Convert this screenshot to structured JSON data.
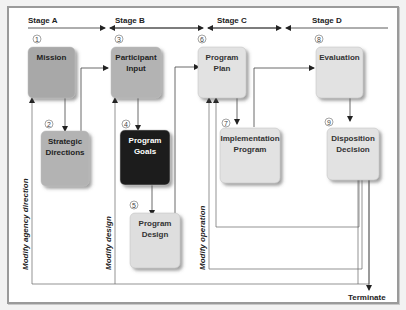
{
  "stages": [
    {
      "id": "A",
      "label": "Stage A"
    },
    {
      "id": "B",
      "label": "Stage B"
    },
    {
      "id": "C",
      "label": "Stage C"
    },
    {
      "id": "D",
      "label": "Stage D"
    }
  ],
  "nodes": [
    {
      "num": "1",
      "lines": [
        "Mission"
      ],
      "fill": "#a8a8a8",
      "text": "#222222"
    },
    {
      "num": "2",
      "lines": [
        "Strategic",
        "Directions"
      ],
      "fill": "#b3b3b3",
      "text": "#222222"
    },
    {
      "num": "3",
      "lines": [
        "Participant",
        "Input"
      ],
      "fill": "#b3b3b3",
      "text": "#222222"
    },
    {
      "num": "4",
      "lines": [
        "Program",
        "Goals"
      ],
      "fill": "#1e1e1e",
      "text": "#ffffff"
    },
    {
      "num": "5",
      "lines": [
        "Program",
        "Design"
      ],
      "fill": "#dedede",
      "text": "#333333"
    },
    {
      "num": "6",
      "lines": [
        "Program",
        "Plan"
      ],
      "fill": "#e2e2e2",
      "text": "#333333"
    },
    {
      "num": "7",
      "lines": [
        "Implementation",
        "Program"
      ],
      "fill": "#e2e2e2",
      "text": "#333333"
    },
    {
      "num": "8",
      "lines": [
        "Evaluation"
      ],
      "fill": "#e2e2e2",
      "text": "#333333"
    },
    {
      "num": "9",
      "lines": [
        "Disposition",
        "Decision"
      ],
      "fill": "#e2e2e2",
      "text": "#333333"
    }
  ],
  "feedback_labels": {
    "agency": "Modify agency direction",
    "design": "Modify design",
    "operation": "Modify operation"
  },
  "terminate_label": "Terminate"
}
